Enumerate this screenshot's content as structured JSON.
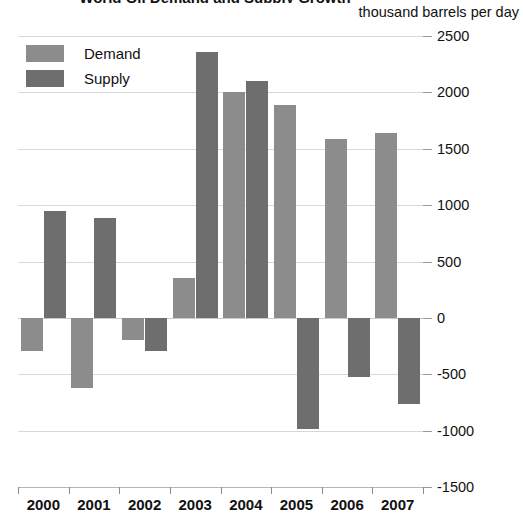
{
  "chart_data": {
    "type": "bar",
    "title": "World Oil Demand and Supply Growth",
    "subtitle": "",
    "unit_caption": "thousand barrels per day",
    "xlabel": "",
    "ylabel": "thousand barrels per day",
    "categories": [
      "2000",
      "2001",
      "2002",
      "2003",
      "2004",
      "2005",
      "2006",
      "2007"
    ],
    "series": [
      {
        "name": "Demand",
        "color": "#8c8c8c",
        "values": [
          -290,
          -620,
          -200,
          350,
          2000,
          1890,
          1590,
          1640
        ]
      },
      {
        "name": "Supply",
        "color": "#6e6e6e",
        "values": [
          950,
          890,
          -290,
          2360,
          2100,
          -990,
          -520,
          -760
        ]
      }
    ],
    "ylim": [
      -1500,
      2500
    ],
    "yticks": [
      2500,
      2000,
      1500,
      1000,
      500,
      0,
      -500,
      -1000,
      -1500
    ],
    "ytick_labels": [
      "2500",
      "2000",
      "1500",
      "1000",
      "500",
      "0",
      "-500",
      "-1000",
      "-1500"
    ],
    "grid": true,
    "legend_position": "top-left",
    "legend": [
      "Demand",
      "Supply"
    ]
  }
}
